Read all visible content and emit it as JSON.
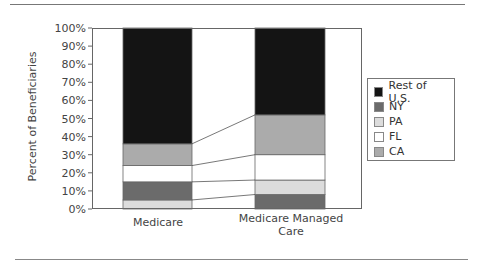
{
  "chart_data": {
    "type": "bar",
    "stacked": true,
    "percent": true,
    "title": "",
    "xlabel": "",
    "ylabel": "Percent of Beneficiaries",
    "ylim": [
      0,
      100
    ],
    "yticks": [
      "0%",
      "10%",
      "20%",
      "30%",
      "40%",
      "50%",
      "60%",
      "70%",
      "80%",
      "90%",
      "100%"
    ],
    "categories": [
      "Medicare",
      "Medicare Managed Care"
    ],
    "series": [
      {
        "name": "Rest of U.S.",
        "color": "#141414",
        "values": [
          64,
          48
        ]
      },
      {
        "name": "NY",
        "color": "#6b6b6b",
        "values": [
          10,
          8
        ]
      },
      {
        "name": "PA",
        "color": "#dcdcdc",
        "values": [
          5,
          8
        ]
      },
      {
        "name": "FL",
        "color": "#ffffff",
        "values": [
          9,
          14
        ]
      },
      {
        "name": "CA",
        "color": "#ababab",
        "values": [
          12,
          22
        ]
      }
    ],
    "stack_order_bottom_to_top": [
      [
        "PA",
        "NY",
        "FL",
        "CA",
        "Rest of U.S."
      ],
      [
        "NY",
        "PA",
        "FL",
        "CA",
        "Rest of U.S."
      ]
    ],
    "connector_lines": true,
    "grid": false,
    "legend_position": "right"
  },
  "labels": {
    "ylabel": "Percent of Beneficiaries",
    "x0": "Medicare",
    "x1_line1": "Medicare Managed",
    "x1_line2": "Care"
  },
  "legend": [
    {
      "label": "Rest of U.S.",
      "color": "#141414"
    },
    {
      "label": "NY",
      "color": "#6b6b6b"
    },
    {
      "label": "PA",
      "color": "#dcdcdc"
    },
    {
      "label": "FL",
      "color": "#ffffff"
    },
    {
      "label": "CA",
      "color": "#ababab"
    }
  ]
}
